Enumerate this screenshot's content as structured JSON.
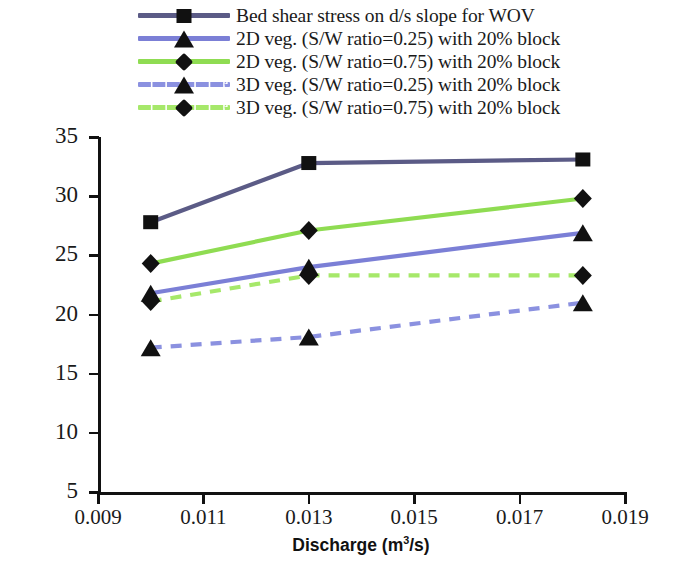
{
  "chart_data": {
    "type": "line",
    "title": "",
    "xlabel": "Discharge (m3/s)",
    "xlabel_html": "Discharge (m<sup>3</sup>/s)",
    "ylabel": "Bed Shear Stress BVR along d/s slope (N/m2)",
    "ylabel_html": "Bed Shear Stress BVR along d/s slope (N/m<sup>2</sup>)",
    "xlim": [
      0.009,
      0.019
    ],
    "ylim": [
      5,
      35
    ],
    "xticks": [
      "0.009",
      "0.011",
      "0.013",
      "0.015",
      "0.017",
      "0.019"
    ],
    "xtick_values": [
      0.009,
      0.011,
      0.013,
      0.015,
      0.017,
      0.019
    ],
    "yticks": [
      "5",
      "10",
      "15",
      "20",
      "25",
      "30",
      "35"
    ],
    "ytick_values": [
      5,
      10,
      15,
      20,
      25,
      30,
      35
    ],
    "grid": false,
    "legend_position": "top",
    "x": [
      0.01,
      0.013,
      0.0182
    ],
    "series": [
      {
        "name": "Bed shear stress on d/s slope for WOV",
        "values": [
          27.8,
          32.8,
          33.1
        ],
        "color": "#5b5b86",
        "marker": "square",
        "dash": false
      },
      {
        "name": "2D veg. (S/W ratio=0.25) with 20% block",
        "values": [
          21.8,
          24.0,
          26.9
        ],
        "color": "#7b7fd6",
        "marker": "triangle",
        "dash": false
      },
      {
        "name": "2D veg. (S/W ratio=0.75) with 20% block",
        "values": [
          24.3,
          27.1,
          29.8
        ],
        "color": "#8fdc52",
        "marker": "diamond",
        "dash": false
      },
      {
        "name": "3D veg. (S/W ratio=0.25) with 20% block",
        "values": [
          17.2,
          18.1,
          21.0
        ],
        "color": "#8b91e0",
        "marker": "triangle",
        "dash": true
      },
      {
        "name": "3D veg. (S/W ratio=0.75) with 20% block",
        "values": [
          21.1,
          23.3,
          23.3
        ],
        "color": "#a6e86a",
        "marker": "diamond",
        "dash": true
      }
    ]
  },
  "legend": {
    "items": [
      {
        "label": "Bed shear stress on d/s slope for WOV"
      },
      {
        "label": "2D veg. (S/W ratio=0.25) with 20% block"
      },
      {
        "label": "2D veg. (S/W ratio=0.75) with 20% block"
      },
      {
        "label": "3D veg. (S/W ratio=0.25) with 20% block"
      },
      {
        "label": "3D veg. (S/W ratio=0.75) with 20% block"
      }
    ]
  },
  "axes": {
    "y_title": "Bed Shear Stress BVR along d/s slope (N/m",
    "y_title_sup": "2",
    "y_title_tail": ")",
    "x_title": "Discharge (m",
    "x_title_sup": "3",
    "x_title_tail": "/s)"
  }
}
